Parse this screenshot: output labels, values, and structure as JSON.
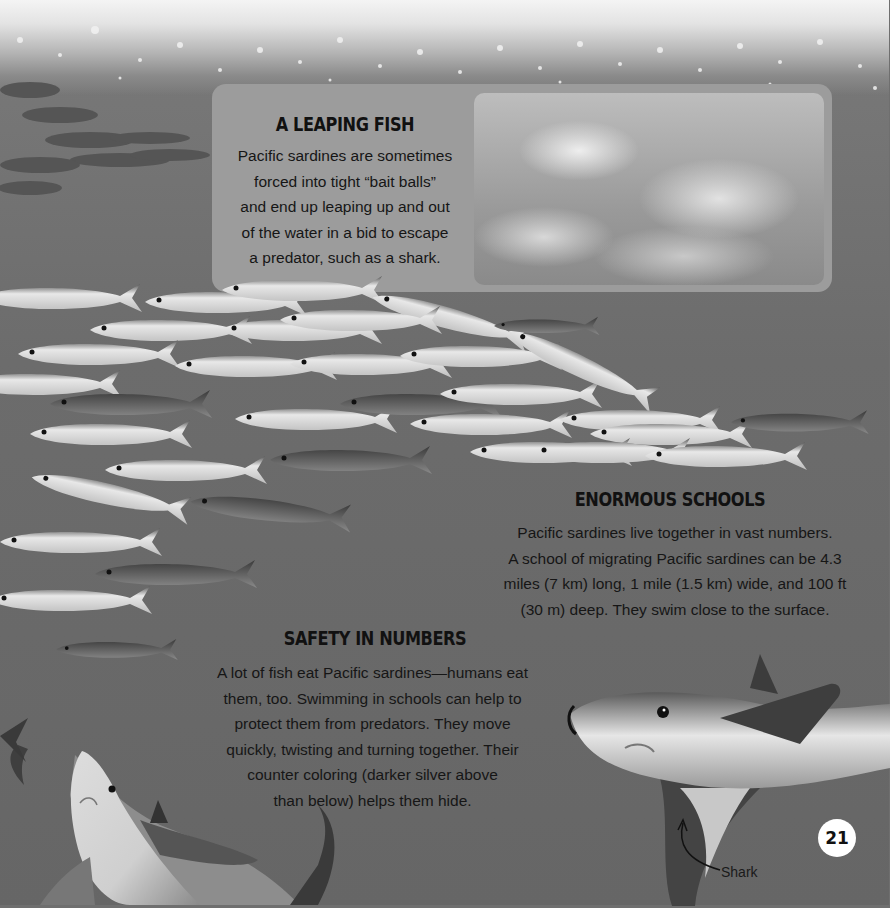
{
  "page": {
    "number": "21",
    "background_color": "#6f6f6f"
  },
  "sections": {
    "leaping": {
      "title": "A LEAPING FISH",
      "lines": [
        "Pacific sardines are sometimes",
        "forced into tight “bait balls”",
        "and end up leaping up and out",
        "of the water in a bid to escape",
        "a predator, such as a shark."
      ],
      "photo_alt": "sardines leaping out of foamy water"
    },
    "schools": {
      "title": "ENORMOUS SCHOOLS",
      "lines": [
        "Pacific sardines live together in vast numbers.",
        "A school of migrating Pacific sardines can be 4.3",
        "miles (7 km) long, 1 mile (1.5 km) wide, and 100 ft",
        "(30 m) deep. They swim close to the surface."
      ]
    },
    "safety": {
      "title": "SAFETY IN NUMBERS",
      "lines": [
        "A lot of fish eat Pacific sardines—humans eat",
        "them, too. Swimming in schools can help to",
        "protect them from predators. They move",
        "quickly, twisting and turning together. Their",
        "counter coloring (darker silver above",
        "than below) helps them hide."
      ]
    }
  },
  "labels": {
    "shark": "Shark"
  }
}
